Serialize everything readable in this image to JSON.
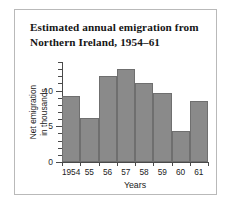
{
  "title": {
    "line1": "Estimated annual emigration from",
    "line2": "Northern Ireland, 1954–61"
  },
  "colors": {
    "bar_fill": "#8a8a8a",
    "bar_edge": "#6f6f6f",
    "axis": "#4a4a4a",
    "frame": "#b9b9b9",
    "background": "#ffffff",
    "text": "#222222"
  },
  "axis_labels": {
    "x": "Years",
    "y_line1": "Net emigration",
    "y_line2": "in thousands"
  },
  "chart_data": {
    "type": "bar",
    "title": "Estimated annual emigration from Northern Ireland, 1954–61",
    "xlabel": "Years",
    "ylabel": "Net emigration in thousands",
    "categories": [
      "1954",
      "55",
      "56",
      "57",
      "58",
      "59",
      "60",
      "61"
    ],
    "values": [
      9.3,
      6.1,
      12.0,
      13.0,
      11.0,
      9.7,
      4.3,
      8.6
    ],
    "ylim": [
      0,
      14
    ],
    "ytick_values": [
      0,
      1,
      2,
      3,
      4,
      5,
      6,
      7,
      8,
      9,
      10,
      11,
      12,
      13,
      14
    ],
    "ytick_labels": [
      {
        "value": 0,
        "label": "0"
      },
      {
        "value": 5,
        "label": "5"
      },
      {
        "value": 10,
        "label": "10"
      }
    ],
    "grid": false,
    "legend": null
  }
}
